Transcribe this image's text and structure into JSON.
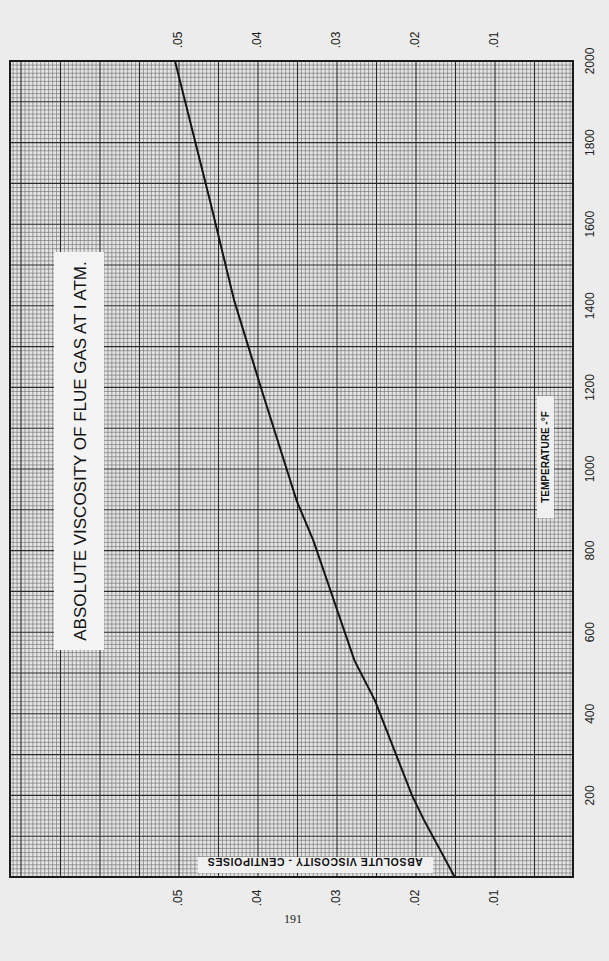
{
  "page": {
    "page_number": "191"
  },
  "chart_data": {
    "type": "line",
    "title": "ABSOLUTE VISCOSITY OF FLUE GAS AT I ATM.",
    "xlabel": "TEMPERATURE -°F",
    "ylabel": "ABSOLUTE VISCOSITY - CENTIPOISES",
    "x_ticks": [
      "200",
      "400",
      "600",
      "800",
      "1000",
      "1200",
      "1400",
      "1600",
      "1800",
      "2000"
    ],
    "x_tick_values": [
      200,
      400,
      600,
      800,
      1000,
      1200,
      1400,
      1600,
      1800,
      2000
    ],
    "y_ticks": [
      ".01",
      ".02",
      ".03",
      ".04",
      ".05"
    ],
    "y_tick_values": [
      0.01,
      0.02,
      0.03,
      0.04,
      0.05
    ],
    "xlim": [
      0,
      2000
    ],
    "ylim": [
      0,
      0.071
    ],
    "grid": true,
    "orientation": "rotated 90° clockwise on page (temperature runs top-to-bottom, viscosity increases right-to-left)",
    "series": [
      {
        "name": "Flue gas viscosity",
        "x": [
          0,
          140,
          200,
          433,
          531,
          825,
          922,
          1192,
          1412,
          1659,
          2000
        ],
        "values": [
          0.0151,
          0.019,
          0.0205,
          0.0252,
          0.0278,
          0.033,
          0.0351,
          0.0395,
          0.043,
          0.0461,
          0.0505
        ]
      }
    ]
  }
}
